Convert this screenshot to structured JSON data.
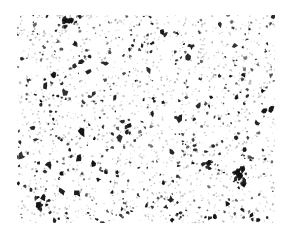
{
  "image": {
    "width": 289,
    "height": 234,
    "background": "#ffffff",
    "description": "Black speckle texture on white background",
    "field": {
      "x": 17,
      "y": 15,
      "width": 258,
      "height": 208
    },
    "speckle": {
      "seed": 20240611,
      "count_fine": 1400,
      "count_medium": 420,
      "count_large": 70,
      "clusters": [
        {
          "x": 240,
          "y": 175,
          "r": 9,
          "n": 26
        },
        {
          "x": 68,
          "y": 22,
          "r": 5,
          "n": 10
        },
        {
          "x": 38,
          "y": 207,
          "r": 5,
          "n": 8
        },
        {
          "x": 208,
          "y": 164,
          "r": 5,
          "n": 8
        }
      ],
      "ink_color": "#111111",
      "faint_color": "#9a9a9a"
    }
  }
}
